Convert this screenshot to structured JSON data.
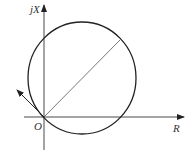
{
  "diagram": {
    "type": "impedance-circle-diagram",
    "labels": {
      "vertical_axis": "jX",
      "horizontal_axis": "R",
      "origin": "O"
    },
    "elements": [
      "horizontal axis arrow (R)",
      "vertical axis arrow (jX)",
      "circle passing through origin",
      "diameter/chord from origin to upper-right of circle",
      "tangent arrow at origin pointing upper-left"
    ],
    "colors": {
      "stroke": "#222222",
      "chord": "#555555",
      "text": "#333333"
    }
  }
}
